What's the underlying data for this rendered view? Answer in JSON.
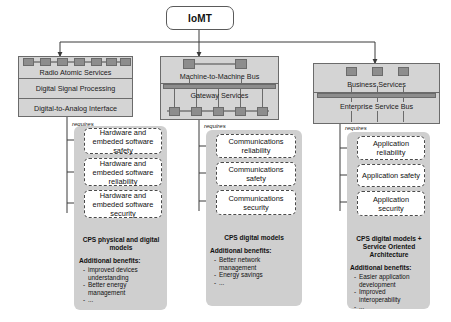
{
  "diagram": {
    "root": {
      "label": "IoMT"
    },
    "columns": [
      {
        "id": "radio",
        "layer_rows": [
          "Radio Atomic Services",
          "Digital Signal Processing",
          "Digital-to-Analog Interface"
        ],
        "requires_label": "requires",
        "requirements": [
          "Hardware and embeded software safety",
          "Hardware and embeded software reliability",
          "Hardware and embeded software security"
        ],
        "summary_title": "CPS physical and digital models",
        "benefits_heading": "Additional benefits:",
        "benefits": [
          "improved devices understanding",
          "Better energy management",
          "..."
        ]
      },
      {
        "id": "m2m",
        "layer_rows": [
          "Machine-to-Machine Bus",
          "Gateway Services"
        ],
        "requires_label": "requires",
        "requirements": [
          "Communications reliability",
          "Communications safety",
          "Communications security"
        ],
        "summary_title": "CPS digital models",
        "benefits_heading": "Additional benefits:",
        "benefits": [
          "Better network management",
          "Energy savings",
          "..."
        ]
      },
      {
        "id": "business",
        "layer_rows": [
          "Business Services",
          "Enterprise Service Bus"
        ],
        "requires_label": "requires",
        "requirements": [
          "Application reliability",
          "Application safety",
          "Application security"
        ],
        "summary_title": "CPS digital models + Service Oriented Architecture",
        "benefits_heading": "Additional benefits:",
        "benefits": [
          "Easier application development",
          "Improved interoperability",
          "..."
        ]
      }
    ],
    "colors": {
      "layer_fill": "#d4d4d4",
      "layer_stroke": "#6b6b6b",
      "panel_fill": "#cfcfcf",
      "node_fill": "#8d8d8d",
      "box_fill": "#ffffff",
      "text": "#111111"
    }
  }
}
